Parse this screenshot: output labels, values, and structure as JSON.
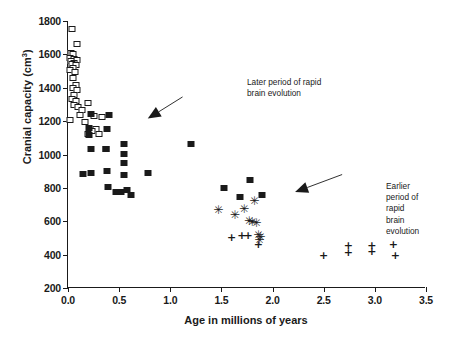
{
  "chart_data": {
    "type": "scatter",
    "title": "",
    "xlabel": "Age in millions of years",
    "ylabel": "Cranial capacity (cm³)",
    "xlim": [
      0.0,
      3.5
    ],
    "ylim": [
      200,
      1800
    ],
    "xticks": [
      "0.0",
      "0.5",
      "1.0",
      "1.5",
      "2.0",
      "2.5",
      "3.0",
      "3.5"
    ],
    "xtick_values": [
      0.0,
      0.5,
      1.0,
      1.5,
      2.0,
      2.5,
      3.0,
      3.5
    ],
    "yticks": [
      "200",
      "400",
      "600",
      "800",
      "1000",
      "1200",
      "1400",
      "1600",
      "1800"
    ],
    "ytick_values": [
      200,
      400,
      600,
      800,
      1000,
      1200,
      1400,
      1600,
      1800
    ],
    "grid": false,
    "legend": "none",
    "marker_color": "#1a1a1a",
    "series": [
      {
        "name": "open-square",
        "marker": "open-square",
        "points": [
          [
            0.04,
            1750
          ],
          [
            0.09,
            1660
          ],
          [
            0.03,
            1610
          ],
          [
            0.05,
            1600
          ],
          [
            0.02,
            1580
          ],
          [
            0.06,
            1575
          ],
          [
            0.09,
            1565
          ],
          [
            0.03,
            1560
          ],
          [
            0.06,
            1550
          ],
          [
            0.04,
            1540
          ],
          [
            0.08,
            1535
          ],
          [
            0.05,
            1520
          ],
          [
            0.02,
            1505
          ],
          [
            0.07,
            1495
          ],
          [
            0.05,
            1460
          ],
          [
            0.08,
            1415
          ],
          [
            0.05,
            1400
          ],
          [
            0.09,
            1385
          ],
          [
            0.06,
            1355
          ],
          [
            0.04,
            1330
          ],
          [
            0.08,
            1320
          ],
          [
            0.2,
            1310
          ],
          [
            0.06,
            1295
          ],
          [
            0.1,
            1285
          ],
          [
            0.14,
            1265
          ],
          [
            0.02,
            1205
          ],
          [
            0.12,
            1235
          ],
          [
            0.25,
            1230
          ],
          [
            0.33,
            1225
          ],
          [
            0.17,
            1195
          ],
          [
            0.27,
            1150
          ],
          [
            0.23,
            1140
          ],
          [
            0.2,
            1125
          ],
          [
            0.3,
            1120
          ]
        ]
      },
      {
        "name": "filled-square",
        "marker": "filled-square",
        "points": [
          [
            0.22,
            1240
          ],
          [
            0.4,
            1235
          ],
          [
            0.21,
            1160
          ],
          [
            0.21,
            1115
          ],
          [
            0.38,
            1150
          ],
          [
            0.15,
            885
          ],
          [
            0.22,
            1030
          ],
          [
            0.37,
            1030
          ],
          [
            0.55,
            1060
          ],
          [
            0.37,
            1035
          ],
          [
            0.22,
            890
          ],
          [
            0.38,
            900
          ],
          [
            0.55,
            1005
          ],
          [
            0.55,
            950
          ],
          [
            0.39,
            805
          ],
          [
            0.55,
            880
          ],
          [
            0.47,
            775
          ],
          [
            0.58,
            790
          ],
          [
            0.62,
            760
          ],
          [
            0.52,
            775
          ],
          [
            0.78,
            890
          ],
          [
            1.2,
            1060
          ],
          [
            1.53,
            800
          ],
          [
            1.78,
            845
          ],
          [
            1.9,
            760
          ],
          [
            1.68,
            745
          ]
        ]
      },
      {
        "name": "asterisk",
        "marker": "asterisk",
        "points": [
          [
            1.82,
            720
          ],
          [
            1.47,
            670
          ],
          [
            1.72,
            675
          ],
          [
            1.63,
            640
          ],
          [
            1.77,
            600
          ],
          [
            1.8,
            595
          ],
          [
            1.84,
            590
          ],
          [
            1.86,
            520
          ],
          [
            1.88,
            505
          ],
          [
            1.87,
            485
          ]
        ]
      },
      {
        "name": "plus",
        "marker": "plus",
        "points": [
          [
            1.6,
            505
          ],
          [
            1.7,
            520
          ],
          [
            1.76,
            518
          ],
          [
            1.86,
            465
          ],
          [
            2.5,
            395
          ],
          [
            2.74,
            460
          ],
          [
            2.74,
            415
          ],
          [
            2.97,
            460
          ],
          [
            2.97,
            420
          ],
          [
            3.18,
            465
          ],
          [
            3.2,
            400
          ]
        ]
      }
    ],
    "annotations": [
      {
        "id": "later",
        "text": "Later period of rapid\nbrain evolution",
        "arrow_from": [
          1.12,
          1345
        ],
        "arrow_to": [
          0.78,
          1215
        ]
      },
      {
        "id": "earlier",
        "text": "Earlier period of rapid\nbrain evolution",
        "arrow_from": [
          2.68,
          880
        ],
        "arrow_to": [
          2.22,
          775
        ]
      }
    ]
  }
}
